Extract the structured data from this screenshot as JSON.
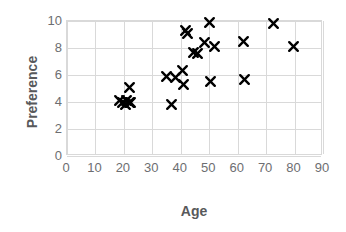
{
  "chart_data": {
    "type": "scatter",
    "title": "",
    "xlabel": "Age",
    "ylabel": "Preference",
    "xlim": [
      0,
      90
    ],
    "ylim": [
      0,
      10
    ],
    "xticks": [
      0,
      10,
      20,
      30,
      40,
      50,
      60,
      70,
      80,
      90
    ],
    "yticks": [
      0,
      2,
      4,
      6,
      8,
      10
    ],
    "grid": true,
    "legend": "none",
    "marker": "x-cross",
    "marker_color": "#000000",
    "grid_color": "#d9d9d9",
    "label_color": "#58595b",
    "tick_color": "#6d6e71",
    "series": [
      {
        "name": "Preference vs Age",
        "points": [
          [
            18.5,
            4.1
          ],
          [
            19.5,
            4.0
          ],
          [
            20.5,
            3.8
          ],
          [
            21.0,
            4.1
          ],
          [
            21.8,
            4.0
          ],
          [
            22.3,
            4.0
          ],
          [
            22.0,
            5.1
          ],
          [
            35.0,
            5.9
          ],
          [
            36.8,
            3.8
          ],
          [
            38.0,
            5.8
          ],
          [
            40.5,
            6.3
          ],
          [
            41.0,
            5.3
          ],
          [
            41.5,
            9.3
          ],
          [
            42.5,
            9.1
          ],
          [
            44.5,
            7.7
          ],
          [
            46.0,
            7.6
          ],
          [
            48.5,
            8.4
          ],
          [
            50.0,
            9.9
          ],
          [
            50.5,
            5.5
          ],
          [
            52.0,
            8.1
          ],
          [
            62.0,
            8.5
          ],
          [
            62.5,
            5.7
          ],
          [
            72.5,
            9.8
          ],
          [
            79.5,
            8.1
          ]
        ]
      }
    ]
  }
}
